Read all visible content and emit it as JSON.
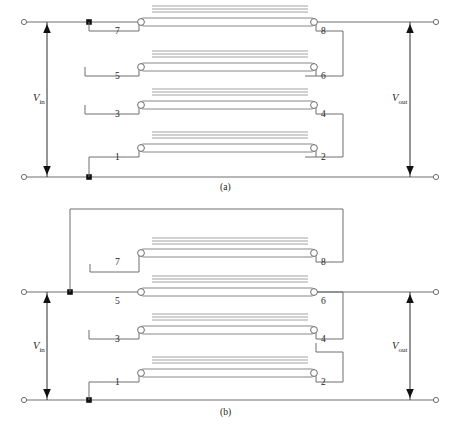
{
  "figure": {
    "caption": "",
    "panels": [
      {
        "id": "a",
        "label": "(a)",
        "left_port_label": "V_in",
        "right_port_label": "V_out",
        "left_port_v": "V",
        "left_port_sub": "in",
        "right_port_v": "V",
        "right_port_sub": "out",
        "resonators": [
          {
            "name": "resonator-7-8",
            "left_node": "7",
            "right_node": "8",
            "row": 1
          },
          {
            "name": "resonator-5-6",
            "left_node": "5",
            "right_node": "6",
            "row": 2
          },
          {
            "name": "resonator-3-4",
            "left_node": "3",
            "right_node": "4",
            "row": 3
          },
          {
            "name": "resonator-1-2",
            "left_node": "1",
            "right_node": "2",
            "row": 4
          }
        ]
      },
      {
        "id": "b",
        "label": "(b)",
        "left_port_label": "V_in",
        "right_port_label": "V_out",
        "left_port_v": "V",
        "left_port_sub": "in",
        "right_port_v": "V",
        "right_port_sub": "out",
        "resonators": [
          {
            "name": "resonator-7-8",
            "left_node": "7",
            "right_node": "8",
            "row": 1
          },
          {
            "name": "resonator-5-6",
            "left_node": "5",
            "right_node": "6",
            "row": 2
          },
          {
            "name": "resonator-3-4",
            "left_node": "3",
            "right_node": "4",
            "row": 3
          },
          {
            "name": "resonator-1-2",
            "left_node": "1",
            "right_node": "2",
            "row": 4
          }
        ]
      }
    ],
    "colors": {
      "wire": "#6e6e6e",
      "resonator_outline": "#7a7a7a",
      "coupling_line": "#8a8a8a",
      "node_fill": "#111111",
      "terminal_fill": "#ffffff",
      "arrow_fill": "#111111",
      "background": "#ffffff",
      "faint_caption": "#cccccc"
    },
    "numbers": {
      "n7": "7",
      "n8": "8",
      "n5": "5",
      "n6": "6",
      "n3": "3",
      "n4": "4",
      "n1": "1",
      "n2": "2"
    }
  }
}
